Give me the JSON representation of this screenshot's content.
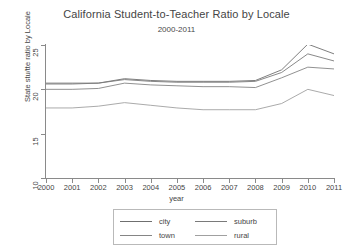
{
  "chart_data": {
    "type": "line",
    "title": "California Student-to-Teacher Ratio by Locale",
    "subtitle": "2000-2011",
    "xlabel": "year",
    "ylabel": "State stu/tte ratio by Locale",
    "x": [
      2000,
      2001,
      2002,
      2003,
      2004,
      2005,
      2006,
      2007,
      2008,
      2009,
      2010,
      2011
    ],
    "categories": [
      "2000",
      "2001",
      "2002",
      "2003",
      "2004",
      "2005",
      "2006",
      "2007",
      "2008",
      "2009",
      "2010",
      "2011"
    ],
    "xlim": [
      2000,
      2011
    ],
    "ylim": [
      10,
      25
    ],
    "yticks": [
      10,
      15,
      20,
      25
    ],
    "xticks": [
      2000,
      2001,
      2002,
      2003,
      2004,
      2005,
      2006,
      2007,
      2008,
      2009,
      2010,
      2011
    ],
    "grid": false,
    "legend_position": "bottom",
    "series": [
      {
        "name": "city",
        "color": "#6f6f6f",
        "values": [
          20.7,
          20.7,
          20.7,
          21.2,
          21.0,
          20.9,
          20.9,
          20.9,
          21.0,
          22.2,
          25.1,
          24.0
        ]
      },
      {
        "name": "suburb",
        "color": "#7a7a7a",
        "values": [
          20.6,
          20.6,
          20.7,
          21.1,
          20.9,
          20.8,
          20.8,
          20.8,
          20.9,
          21.9,
          24.0,
          23.2
        ]
      },
      {
        "name": "town",
        "color": "#858585",
        "values": [
          20.0,
          20.0,
          20.1,
          20.7,
          20.5,
          20.4,
          20.3,
          20.3,
          20.2,
          21.3,
          22.5,
          22.3
        ]
      },
      {
        "name": "rural",
        "color": "#a0a0a0",
        "values": [
          17.9,
          17.9,
          18.1,
          18.5,
          18.2,
          17.9,
          17.7,
          17.7,
          17.7,
          18.4,
          20.0,
          19.3
        ]
      }
    ]
  },
  "legend": {
    "items": [
      {
        "label": "city"
      },
      {
        "label": "suburb"
      },
      {
        "label": "town"
      },
      {
        "label": "rural"
      }
    ]
  }
}
